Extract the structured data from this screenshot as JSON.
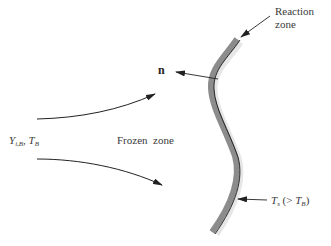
{
  "diagram": {
    "labels": {
      "reaction_zone_line1": "Reaction",
      "reaction_zone_line2": "zone",
      "normal_vector": "n",
      "inflow_Y": "Y",
      "inflow_Y_sub": "i,B",
      "inflow_sep": ", ",
      "inflow_T": "T",
      "inflow_T_sub": "B",
      "frozen_zone": "Frozen  zone",
      "surface_T": "T",
      "surface_T_sub": "s",
      "surface_cond_open": " (> ",
      "surface_cond_T": "T",
      "surface_cond_T_sub": "B",
      "surface_cond_close": ")"
    },
    "colors": {
      "flame_band": "#8c8c8c",
      "flame_edge": "#1a1a1a",
      "arrows": "#222222",
      "text": "#3a3a3a"
    }
  }
}
